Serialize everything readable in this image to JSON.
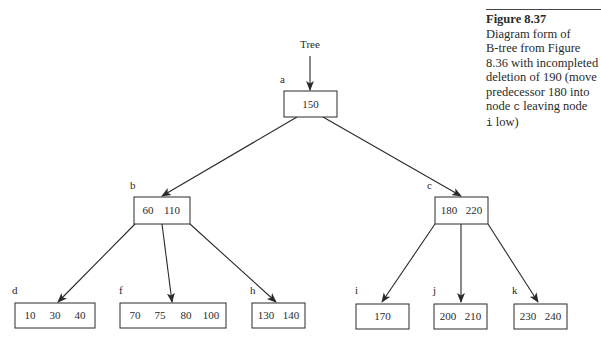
{
  "caption": {
    "title": "Figure 8.37",
    "line1": "Diagram form of",
    "line2": "B-tree from Figure",
    "line3": "8.36 with incompleted",
    "line4": "deletion of 190 (move",
    "line5": "predecessor 180 into",
    "line6a": "node ",
    "line6code": "c",
    "line6b": " leaving node",
    "line7code": "i",
    "line7b": " low)"
  },
  "tree": {
    "root_label": "Tree",
    "nodes": {
      "a": {
        "label": "a",
        "keys": [
          "150"
        ]
      },
      "b": {
        "label": "b",
        "keys": [
          "60",
          "110"
        ]
      },
      "c": {
        "label": "c",
        "keys": [
          "180",
          "220"
        ]
      },
      "d": {
        "label": "d",
        "keys": [
          "10",
          "30",
          "40"
        ]
      },
      "f": {
        "label": "f",
        "keys": [
          "70",
          "75",
          "80",
          "100"
        ]
      },
      "h": {
        "label": "h",
        "keys": [
          "130",
          "140"
        ]
      },
      "i": {
        "label": "i",
        "keys": [
          "170"
        ]
      },
      "j": {
        "label": "j",
        "keys": [
          "200",
          "210"
        ]
      },
      "k": {
        "label": "k",
        "keys": [
          "230",
          "240"
        ]
      }
    },
    "edges": [
      [
        "a",
        "b"
      ],
      [
        "a",
        "c"
      ],
      [
        "b",
        "d"
      ],
      [
        "b",
        "f"
      ],
      [
        "b",
        "h"
      ],
      [
        "c",
        "i"
      ],
      [
        "c",
        "j"
      ],
      [
        "c",
        "k"
      ]
    ]
  }
}
